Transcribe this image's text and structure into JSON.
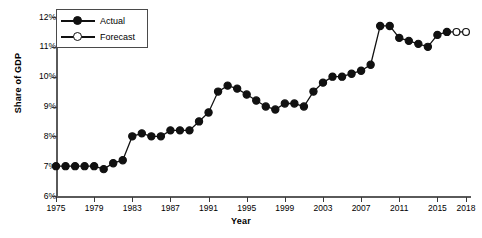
{
  "chart_data": {
    "type": "line",
    "title": "",
    "xlabel": "Year",
    "ylabel": "Share of GDP",
    "xlim": [
      1975,
      2018
    ],
    "ylim": [
      6,
      12
    ],
    "xticks": [
      1975,
      1979,
      1983,
      1987,
      1991,
      1995,
      1999,
      2003,
      2007,
      2011,
      2015,
      2018
    ],
    "xtick_labels": [
      "1975",
      "1979",
      "1983",
      "1987",
      "1991",
      "1995",
      "1999",
      "2003",
      "2007",
      "2011",
      "2015",
      "2018"
    ],
    "yticks": [
      6,
      7,
      8,
      9,
      10,
      11,
      12
    ],
    "ytick_labels": [
      "6%",
      "7%",
      "8%",
      "9%",
      "10%",
      "11%",
      "12%"
    ],
    "grid": false,
    "legend_position": "top-left",
    "series": [
      {
        "name": "Actual",
        "marker": "filled-circle",
        "x": [
          1975,
          1976,
          1977,
          1978,
          1979,
          1980,
          1981,
          1982,
          1983,
          1984,
          1985,
          1986,
          1987,
          1988,
          1989,
          1990,
          1991,
          1992,
          1993,
          1994,
          1995,
          1996,
          1997,
          1998,
          1999,
          2000,
          2001,
          2002,
          2003,
          2004,
          2005,
          2006,
          2007,
          2008,
          2009,
          2010,
          2011,
          2012,
          2013,
          2014,
          2015,
          2016
        ],
        "values": [
          7.0,
          7.0,
          7.0,
          7.0,
          7.0,
          6.9,
          7.1,
          7.2,
          8.0,
          8.1,
          8.0,
          8.0,
          8.2,
          8.2,
          8.2,
          8.5,
          8.8,
          9.5,
          9.7,
          9.6,
          9.4,
          9.2,
          9.0,
          8.9,
          9.1,
          9.1,
          9.0,
          9.5,
          9.8,
          10.0,
          10.0,
          10.1,
          10.2,
          10.4,
          11.7,
          11.7,
          11.3,
          11.2,
          11.1,
          11.0,
          11.4,
          11.5
        ],
        "color": "#111111"
      },
      {
        "name": "Forecast",
        "marker": "open-circle",
        "x": [
          2017,
          2018
        ],
        "values": [
          11.5,
          11.5
        ],
        "color": "#111111"
      }
    ],
    "legend": [
      {
        "label": "Actual",
        "marker": "filled-circle"
      },
      {
        "label": "Forecast",
        "marker": "open-circle"
      }
    ]
  }
}
